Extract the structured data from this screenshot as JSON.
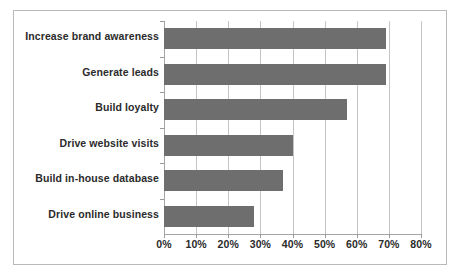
{
  "chart_data": {
    "type": "bar",
    "orientation": "horizontal",
    "title": "",
    "subtitle": "",
    "xlabel": "",
    "ylabel": "",
    "categories": [
      "Increase brand awareness",
      "Generate leads",
      "Build loyalty",
      "Drive website visits",
      "Build in-house database",
      "Drive online business"
    ],
    "values": [
      69,
      69,
      57,
      40,
      37,
      28
    ],
    "value_suffix": "%",
    "xlim": [
      0,
      80
    ],
    "xticks": [
      0,
      10,
      20,
      30,
      40,
      50,
      60,
      70,
      80
    ],
    "xtick_labels": [
      "0%",
      "10%",
      "20%",
      "30%",
      "40%",
      "50%",
      "60%",
      "70%",
      "80%"
    ],
    "grid": true,
    "grid_axis": "x",
    "legend": false,
    "legend_position": "none",
    "series": [
      {
        "name": "",
        "values": [
          69,
          69,
          57,
          40,
          37,
          28
        ]
      }
    ],
    "colors": {
      "bar_fill": "#6e6e6e",
      "gridline": "#c4c4c4",
      "axis_line": "#a5a5a5",
      "frame_border": "#b9b9b9",
      "text": "#2b2b2b",
      "background": "#ffffff"
    }
  }
}
